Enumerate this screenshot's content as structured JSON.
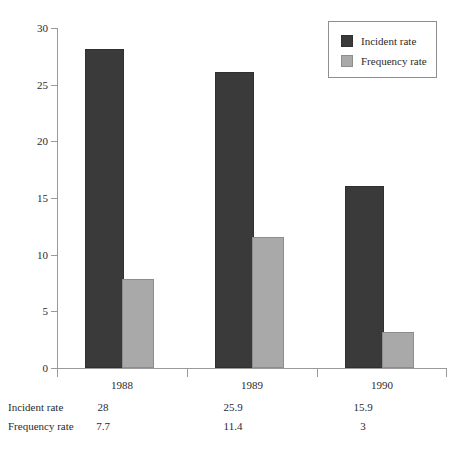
{
  "chart_data": {
    "type": "bar",
    "title": "",
    "xlabel": "",
    "ylabel": "",
    "categories": [
      "1988",
      "1989",
      "1990"
    ],
    "series": [
      {
        "name": "Incident rate",
        "values": [
          28,
          25.9,
          15.9
        ],
        "color": "#3a3a3a"
      },
      {
        "name": "Frequency rate",
        "values": [
          7.7,
          11.4,
          3
        ],
        "color": "#a9a9a9"
      }
    ],
    "ylim": [
      0,
      30
    ],
    "yticks": [
      0,
      5,
      10,
      15,
      20,
      25,
      30
    ],
    "ytick_labels": [
      "0",
      "5",
      "10",
      "15",
      "20",
      "25",
      "30"
    ],
    "grid": false,
    "legend_position": "top-right"
  },
  "legend": {
    "items": [
      {
        "label": "Incident rate",
        "swatch": "incident"
      },
      {
        "label": "Frequency rate",
        "swatch": "frequency"
      }
    ]
  },
  "table": {
    "rows": [
      {
        "label": "Incident rate",
        "values": [
          "28",
          "25.9",
          "15.9"
        ]
      },
      {
        "label": "Frequency rate",
        "values": [
          "7.7",
          "11.4",
          "3"
        ]
      }
    ]
  }
}
